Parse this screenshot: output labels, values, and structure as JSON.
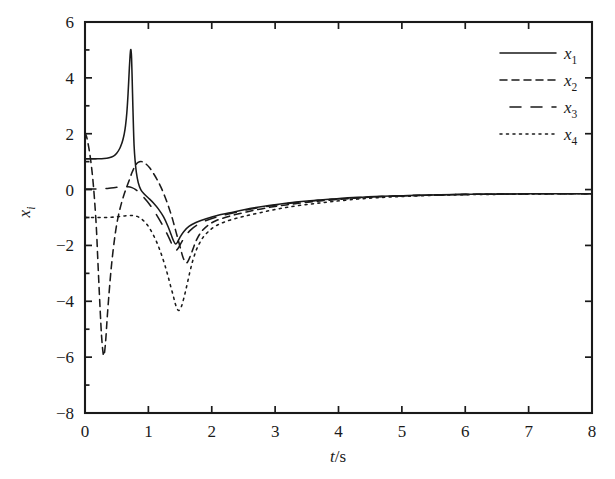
{
  "chart_data": {
    "type": "line",
    "title": "",
    "xlabel": "t/s",
    "ylabel": "x_i",
    "xlabel_parts": {
      "italic": "t",
      "plain": "/s"
    },
    "ylabel_parts": {
      "base": "x",
      "subscript": "i"
    },
    "xlim": [
      0,
      8
    ],
    "ylim": [
      -8,
      6
    ],
    "xticks": [
      0,
      1,
      2,
      3,
      4,
      5,
      6,
      7,
      8
    ],
    "yticks": [
      6,
      4,
      2,
      0,
      -2,
      -4,
      -6,
      -8
    ],
    "xtick_labels": [
      "0",
      "1",
      "2",
      "3",
      "4",
      "5",
      "6",
      "7",
      "8"
    ],
    "ytick_labels": [
      "6",
      "4",
      "2",
      "0",
      "-2",
      "-4",
      "-6",
      "-8"
    ],
    "grid": false,
    "legend_position": "upper right",
    "line_color": "#1a1a1a",
    "series": [
      {
        "name": "x1",
        "label_base": "x",
        "label_sub": "1",
        "style": "solid",
        "dash": "none",
        "points": [
          [
            0.0,
            1.1
          ],
          [
            0.1,
            1.1
          ],
          [
            0.2,
            1.1
          ],
          [
            0.3,
            1.11
          ],
          [
            0.38,
            1.14
          ],
          [
            0.45,
            1.2
          ],
          [
            0.5,
            1.3
          ],
          [
            0.55,
            1.48
          ],
          [
            0.58,
            1.65
          ],
          [
            0.6,
            1.8
          ],
          [
            0.62,
            2.0
          ],
          [
            0.64,
            2.3
          ],
          [
            0.66,
            2.75
          ],
          [
            0.68,
            3.45
          ],
          [
            0.7,
            4.35
          ],
          [
            0.715,
            4.9
          ],
          [
            0.725,
            5.0
          ],
          [
            0.735,
            4.7
          ],
          [
            0.745,
            3.9
          ],
          [
            0.755,
            3.0
          ],
          [
            0.765,
            2.2
          ],
          [
            0.775,
            1.55
          ],
          [
            0.79,
            1.05
          ],
          [
            0.81,
            0.62
          ],
          [
            0.84,
            0.25
          ],
          [
            0.88,
            0.0
          ],
          [
            0.93,
            -0.15
          ],
          [
            1.0,
            -0.3
          ],
          [
            1.08,
            -0.48
          ],
          [
            1.16,
            -0.7
          ],
          [
            1.24,
            -0.98
          ],
          [
            1.31,
            -1.32
          ],
          [
            1.36,
            -1.62
          ],
          [
            1.4,
            -1.85
          ],
          [
            1.43,
            -1.95
          ],
          [
            1.46,
            -1.88
          ],
          [
            1.5,
            -1.7
          ],
          [
            1.56,
            -1.5
          ],
          [
            1.64,
            -1.32
          ],
          [
            1.75,
            -1.18
          ],
          [
            1.9,
            -1.05
          ],
          [
            2.1,
            -0.92
          ],
          [
            2.35,
            -0.8
          ],
          [
            2.6,
            -0.68
          ],
          [
            2.9,
            -0.57
          ],
          [
            3.2,
            -0.48
          ],
          [
            3.55,
            -0.4
          ],
          [
            3.9,
            -0.34
          ],
          [
            4.3,
            -0.28
          ],
          [
            4.7,
            -0.24
          ],
          [
            5.1,
            -0.21
          ],
          [
            5.6,
            -0.19
          ],
          [
            6.1,
            -0.17
          ],
          [
            6.6,
            -0.16
          ],
          [
            7.1,
            -0.15
          ],
          [
            7.6,
            -0.15
          ],
          [
            8.0,
            -0.15
          ]
        ]
      },
      {
        "name": "x2",
        "label_base": "x",
        "label_sub": "2",
        "style": "dashed",
        "dash": "7,5",
        "points": [
          [
            0.0,
            2.05
          ],
          [
            0.03,
            1.85
          ],
          [
            0.06,
            1.5
          ],
          [
            0.09,
            1.05
          ],
          [
            0.12,
            0.45
          ],
          [
            0.15,
            -0.35
          ],
          [
            0.18,
            -1.4
          ],
          [
            0.2,
            -2.4
          ],
          [
            0.22,
            -3.4
          ],
          [
            0.24,
            -4.35
          ],
          [
            0.26,
            -5.2
          ],
          [
            0.28,
            -5.75
          ],
          [
            0.295,
            -5.95
          ],
          [
            0.31,
            -5.8
          ],
          [
            0.33,
            -5.3
          ],
          [
            0.35,
            -4.6
          ],
          [
            0.38,
            -3.7
          ],
          [
            0.41,
            -2.9
          ],
          [
            0.44,
            -2.25
          ],
          [
            0.47,
            -1.7
          ],
          [
            0.5,
            -1.25
          ],
          [
            0.54,
            -0.8
          ],
          [
            0.58,
            -0.45
          ],
          [
            0.62,
            -0.15
          ],
          [
            0.66,
            0.1
          ],
          [
            0.7,
            0.35
          ],
          [
            0.74,
            0.6
          ],
          [
            0.78,
            0.8
          ],
          [
            0.82,
            0.94
          ],
          [
            0.86,
            1.0
          ],
          [
            0.9,
            1.0
          ],
          [
            0.96,
            0.92
          ],
          [
            1.02,
            0.78
          ],
          [
            1.08,
            0.58
          ],
          [
            1.14,
            0.35
          ],
          [
            1.2,
            0.08
          ],
          [
            1.26,
            -0.25
          ],
          [
            1.32,
            -0.62
          ],
          [
            1.38,
            -1.05
          ],
          [
            1.44,
            -1.55
          ],
          [
            1.5,
            -2.05
          ],
          [
            1.55,
            -2.45
          ],
          [
            1.6,
            -2.62
          ],
          [
            1.64,
            -2.5
          ],
          [
            1.7,
            -2.15
          ],
          [
            1.76,
            -1.8
          ],
          [
            1.84,
            -1.5
          ],
          [
            1.94,
            -1.28
          ],
          [
            2.08,
            -1.1
          ],
          [
            2.3,
            -0.94
          ],
          [
            2.55,
            -0.8
          ],
          [
            2.85,
            -0.66
          ],
          [
            3.2,
            -0.54
          ],
          [
            3.55,
            -0.44
          ],
          [
            3.9,
            -0.37
          ],
          [
            4.3,
            -0.3
          ],
          [
            4.7,
            -0.25
          ],
          [
            5.1,
            -0.22
          ],
          [
            5.6,
            -0.19
          ],
          [
            6.1,
            -0.17
          ],
          [
            6.6,
            -0.16
          ],
          [
            7.1,
            -0.15
          ],
          [
            7.6,
            -0.15
          ],
          [
            8.0,
            -0.15
          ]
        ]
      },
      {
        "name": "x3",
        "label_base": "x",
        "label_sub": "3",
        "style": "dashed-long",
        "dash": "11,10",
        "points": [
          [
            0.0,
            0.02
          ],
          [
            0.12,
            0.02
          ],
          [
            0.25,
            0.03
          ],
          [
            0.38,
            0.05
          ],
          [
            0.5,
            0.08
          ],
          [
            0.6,
            0.1
          ],
          [
            0.68,
            0.1
          ],
          [
            0.74,
            0.07
          ],
          [
            0.8,
            0.0
          ],
          [
            0.86,
            -0.12
          ],
          [
            0.92,
            -0.26
          ],
          [
            0.98,
            -0.42
          ],
          [
            1.04,
            -0.6
          ],
          [
            1.1,
            -0.8
          ],
          [
            1.16,
            -1.02
          ],
          [
            1.22,
            -1.26
          ],
          [
            1.28,
            -1.52
          ],
          [
            1.34,
            -1.8
          ],
          [
            1.39,
            -2.05
          ],
          [
            1.43,
            -2.18
          ],
          [
            1.47,
            -2.1
          ],
          [
            1.52,
            -1.9
          ],
          [
            1.58,
            -1.68
          ],
          [
            1.66,
            -1.46
          ],
          [
            1.76,
            -1.28
          ],
          [
            1.9,
            -1.12
          ],
          [
            2.08,
            -0.98
          ],
          [
            2.3,
            -0.86
          ],
          [
            2.55,
            -0.73
          ],
          [
            2.85,
            -0.61
          ],
          [
            3.2,
            -0.5
          ],
          [
            3.55,
            -0.42
          ],
          [
            3.9,
            -0.35
          ],
          [
            4.3,
            -0.29
          ],
          [
            4.7,
            -0.25
          ],
          [
            5.1,
            -0.22
          ],
          [
            5.6,
            -0.19
          ],
          [
            6.1,
            -0.17
          ],
          [
            6.6,
            -0.16
          ],
          [
            7.1,
            -0.15
          ],
          [
            7.6,
            -0.15
          ],
          [
            8.0,
            -0.15
          ]
        ]
      },
      {
        "name": "x4",
        "label_base": "x",
        "label_sub": "4",
        "style": "dotted",
        "dash": "2,4.5",
        "points": [
          [
            0.0,
            -1.0
          ],
          [
            0.15,
            -1.0
          ],
          [
            0.3,
            -1.0
          ],
          [
            0.42,
            -0.99
          ],
          [
            0.52,
            -0.97
          ],
          [
            0.6,
            -0.95
          ],
          [
            0.68,
            -0.93
          ],
          [
            0.75,
            -0.93
          ],
          [
            0.82,
            -0.96
          ],
          [
            0.88,
            -1.03
          ],
          [
            0.94,
            -1.15
          ],
          [
            1.0,
            -1.32
          ],
          [
            1.06,
            -1.55
          ],
          [
            1.12,
            -1.82
          ],
          [
            1.17,
            -2.1
          ],
          [
            1.22,
            -2.42
          ],
          [
            1.27,
            -2.78
          ],
          [
            1.31,
            -3.1
          ],
          [
            1.35,
            -3.45
          ],
          [
            1.39,
            -3.78
          ],
          [
            1.42,
            -4.05
          ],
          [
            1.45,
            -4.25
          ],
          [
            1.48,
            -4.33
          ],
          [
            1.51,
            -4.25
          ],
          [
            1.54,
            -4.05
          ],
          [
            1.58,
            -3.7
          ],
          [
            1.62,
            -3.3
          ],
          [
            1.66,
            -2.9
          ],
          [
            1.7,
            -2.55
          ],
          [
            1.75,
            -2.2
          ],
          [
            1.8,
            -1.95
          ],
          [
            1.86,
            -1.72
          ],
          [
            1.94,
            -1.52
          ],
          [
            2.05,
            -1.32
          ],
          [
            2.2,
            -1.16
          ],
          [
            2.4,
            -1.02
          ],
          [
            2.62,
            -0.9
          ],
          [
            2.9,
            -0.76
          ],
          [
            3.2,
            -0.63
          ],
          [
            3.55,
            -0.52
          ],
          [
            3.9,
            -0.43
          ],
          [
            4.3,
            -0.34
          ],
          [
            4.7,
            -0.28
          ],
          [
            5.1,
            -0.24
          ],
          [
            5.6,
            -0.2
          ],
          [
            6.1,
            -0.18
          ],
          [
            6.6,
            -0.17
          ],
          [
            7.1,
            -0.16
          ],
          [
            7.6,
            -0.15
          ],
          [
            8.0,
            -0.15
          ]
        ]
      }
    ],
    "legend": [
      {
        "label_base": "x",
        "label_sub": "1",
        "style": "solid"
      },
      {
        "label_base": "x",
        "label_sub": "2",
        "style": "dashed"
      },
      {
        "label_base": "x",
        "label_sub": "3",
        "style": "dashed-long"
      },
      {
        "label_base": "x",
        "label_sub": "4",
        "style": "dotted"
      }
    ]
  }
}
